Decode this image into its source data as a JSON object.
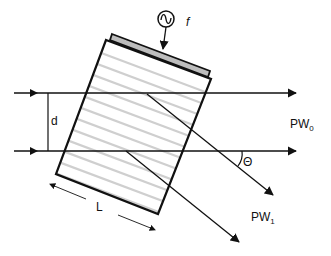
{
  "diagram": {
    "type": "acousto-optic modulator schematic",
    "colors": {
      "line": "#111111",
      "background": "#ffffff",
      "stripe": "#cfcfcf",
      "transducer_fill": "#bdbdbd"
    },
    "labels": {
      "frequency": "f",
      "beam_separation": "d",
      "zero_order_main": "PW",
      "zero_order_sub": "0",
      "first_order_main": "PW",
      "first_order_sub": "1",
      "angle": "Θ",
      "length": "L"
    },
    "components": {
      "rf_source": "sine-wave-source-icon",
      "crystal": "acousto-optic-crystal",
      "transducer": "piezo-transducer"
    }
  }
}
